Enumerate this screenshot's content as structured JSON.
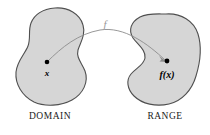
{
  "figure": {
    "kind": "function-mapping-diagram",
    "background_color": "#ffffff",
    "blob_fill_color": "#d6d6d6",
    "blob_stroke_color": "#4f4f4f",
    "curve_color": "#8c8c8c",
    "dot_color": "#000000"
  },
  "domain": {
    "caption": "DOMAIN",
    "element_label": "x"
  },
  "range": {
    "caption": "RANGE",
    "element_label": "f(x)"
  },
  "mapping": {
    "function_label": "f"
  }
}
